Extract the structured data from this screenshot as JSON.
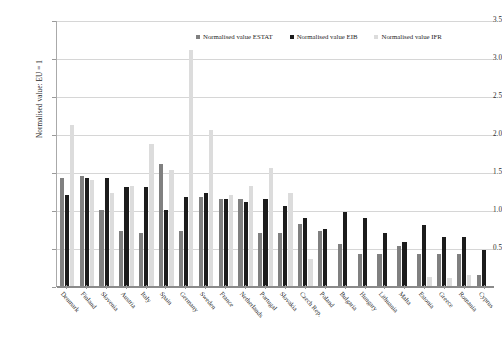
{
  "chart_data": {
    "type": "bar",
    "title": "",
    "xlabel": "",
    "ylabel": "Normalised value: EU = 1",
    "ylim": [
      0,
      3.5
    ],
    "ytick_step": 0.5,
    "yticks": [
      "0.5",
      "1.0",
      "1.5",
      "2.0",
      "2.5",
      "3.0",
      "3.5"
    ],
    "grid": true,
    "legend_position": "top-center",
    "categories": [
      "Denmark",
      "Finland",
      "Slovenia",
      "Austria",
      "Italy",
      "Spain",
      "Germany",
      "Sweden",
      "France",
      "Netherlands",
      "Portugal",
      "Slovakia",
      "Czech Rep.",
      "Poland",
      "Bulgaria",
      "Hungary",
      "Lithuania",
      "Malta",
      "Estonia",
      "Greece",
      "Romania",
      "Cyprus"
    ],
    "series": [
      {
        "name": "Normalised value ESTAT",
        "color": "#808080",
        "values": [
          1.42,
          1.45,
          1.0,
          0.72,
          0.7,
          1.6,
          0.72,
          1.17,
          1.15,
          1.15,
          0.7,
          0.7,
          0.82,
          0.72,
          0.55,
          0.42,
          0.42,
          0.52,
          0.42,
          0.42,
          0.42,
          0.14
        ]
      },
      {
        "name": "Normalised value EIB",
        "color": "#1c1c1c",
        "values": [
          1.2,
          1.42,
          1.42,
          1.3,
          1.3,
          1.0,
          1.17,
          1.22,
          1.15,
          1.1,
          1.15,
          1.05,
          0.9,
          0.75,
          0.98,
          0.9,
          0.7,
          0.58,
          0.8,
          0.65,
          0.65,
          0.48
        ]
      },
      {
        "name": "Normalised value IFR",
        "color": "#dcdcdc",
        "values": [
          2.12,
          1.4,
          1.22,
          1.32,
          1.87,
          1.52,
          3.1,
          2.05,
          1.2,
          1.32,
          1.55,
          1.22,
          0.35,
          0.0,
          0.0,
          0.0,
          0.0,
          0.0,
          0.12,
          0.1,
          0.14,
          0.0
        ]
      }
    ]
  }
}
